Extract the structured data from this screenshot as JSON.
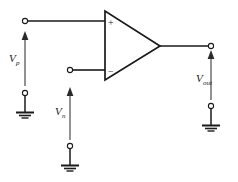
{
  "diagram": {
    "type": "circuit-schematic",
    "colors": {
      "background": "#ffffff",
      "wire": "#1a1a1a",
      "arrow": "#3a3a3a",
      "text": "#1a1a1a"
    },
    "opamp": {
      "name": "operational-amplifier",
      "plus_label": "+",
      "minus_label": "−"
    },
    "labels": {
      "vp": {
        "symbol": "V",
        "subscript": "p",
        "full": "Vp"
      },
      "vn": {
        "symbol": "V",
        "subscript": "n",
        "full": "Vn"
      },
      "vout": {
        "symbol": "V",
        "subscript": "out",
        "full": "Vout"
      }
    },
    "nodes": {
      "noninverting_input_terminal": "input-terminal-plus",
      "inverting_input_terminal": "input-terminal-minus",
      "output_terminal": "output-terminal",
      "ground_left": "ground-symbol-left",
      "ground_middle": "ground-symbol-middle",
      "ground_right": "ground-symbol-right"
    }
  }
}
